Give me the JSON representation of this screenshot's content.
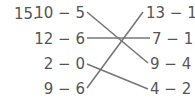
{
  "problem_number": "15.",
  "left_column": [
    "10 − 5",
    "12 − 6",
    "2 − 0",
    "9 − 6"
  ],
  "right_column": [
    "13 − 10",
    "7 − 1",
    "9 − 4",
    "4 − 2"
  ],
  "matches": [
    {
      "left": "10 − 5",
      "right": "9 − 4"
    },
    {
      "left": "12 − 6",
      "right": "7 − 1"
    },
    {
      "left": "2 − 0",
      "right": "4 − 2"
    },
    {
      "left": "9 − 6",
      "right": "13 − 10"
    }
  ],
  "line_color": "#777777"
}
